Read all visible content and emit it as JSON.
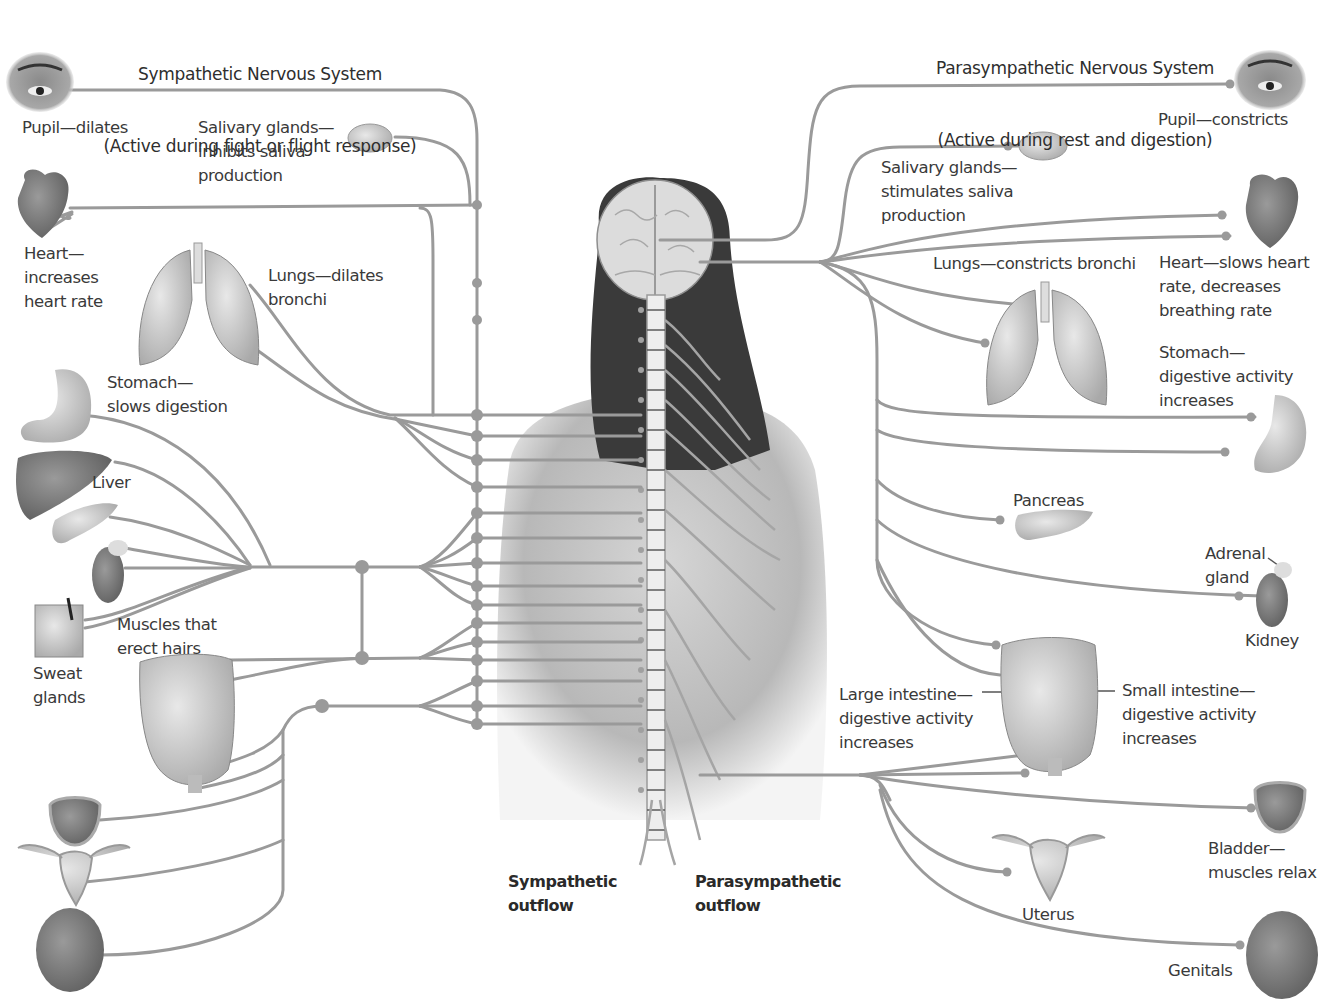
{
  "sympathetic": {
    "title": "Sympathetic Nervous System",
    "subtitle": "(Active during fight or flight response)",
    "labels": {
      "pupil": "Pupil—dilates",
      "salivary": "Salivary glands—\ninhibits saliva\nproduction",
      "heart": "Heart—\nincreases\nheart rate",
      "lungs": "Lungs—dilates\nbronchi",
      "stomach": "Stomach—\nslows digestion",
      "liver": "Liver",
      "muscles": "Muscles that\nerect hairs",
      "sweat": "Sweat\nglands"
    },
    "outflow_label": "Sympathetic\noutflow"
  },
  "parasympathetic": {
    "title": "Parasympathetic Nervous System",
    "subtitle": "(Active during rest and digestion)",
    "labels": {
      "pupil": "Pupil—constricts",
      "salivary": "Salivary glands—\nstimulates saliva\nproduction",
      "lungs": "Lungs—constricts bronchi",
      "heart": "Heart—slows heart\nrate, decreases\nbreathing rate",
      "stomach": "Stomach—\ndigestive activity\nincreases",
      "pancreas": "Pancreas",
      "adrenal": "Adrenal\ngland",
      "kidney": "Kidney",
      "large_intestine": "Large intestine—\ndigestive activity\nincreases",
      "small_intestine": "Small intestine—\ndigestive activity\nincreases",
      "bladder": "Bladder—\nmuscles relax",
      "uterus": "Uterus",
      "genitals": "Genitals"
    },
    "outflow_label": "Parasympathetic\noutflow"
  },
  "colors": {
    "nerve": "#9a9a9a",
    "text": "#3a3a3a",
    "background": "#ffffff"
  }
}
